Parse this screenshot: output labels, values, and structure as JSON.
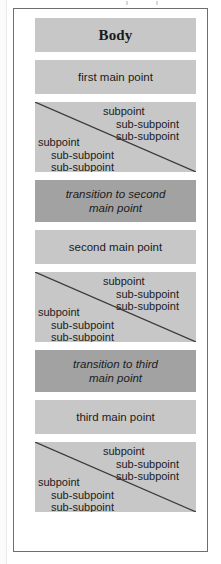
{
  "figure": {
    "title": "Body",
    "blocks": [
      {
        "kind": "title",
        "tone": "light",
        "text": "Body"
      },
      {
        "kind": "main",
        "tone": "light",
        "text": "first main point"
      },
      {
        "kind": "subpoints",
        "tone": "light",
        "diagonal": true,
        "upper_group": [
          "subpoint",
          "sub-subpoint",
          "sub-subpoint"
        ],
        "lower_group": [
          "subpoint",
          "sub-subpoint",
          "sub-subpoint"
        ]
      },
      {
        "kind": "transition",
        "tone": "dark",
        "line1": "transition to second",
        "line2": "main point"
      },
      {
        "kind": "main",
        "tone": "light",
        "text": "second main point"
      },
      {
        "kind": "subpoints",
        "tone": "light",
        "diagonal": true,
        "upper_group": [
          "subpoint",
          "sub-subpoint",
          "sub-subpoint"
        ],
        "lower_group": [
          "subpoint",
          "sub-subpoint",
          "sub-subpoint"
        ]
      },
      {
        "kind": "transition",
        "tone": "dark",
        "line1": "transition to third",
        "line2": "main point"
      },
      {
        "kind": "main",
        "tone": "light",
        "text": "third main point"
      },
      {
        "kind": "subpoints",
        "tone": "light",
        "diagonal": true,
        "upper_group": [
          "subpoint",
          "sub-subpoint",
          "sub-subpoint"
        ],
        "lower_group": [
          "subpoint",
          "sub-subpoint",
          "sub-subpoint"
        ]
      }
    ],
    "colors": {
      "light_block": "#c7c7c7",
      "dark_block": "#a2a2a2",
      "frame_border": "#6f6f6f",
      "text": "#1b1b1b",
      "diagonal_line": "#3a3a3a",
      "page_background": "#ffffff"
    }
  }
}
